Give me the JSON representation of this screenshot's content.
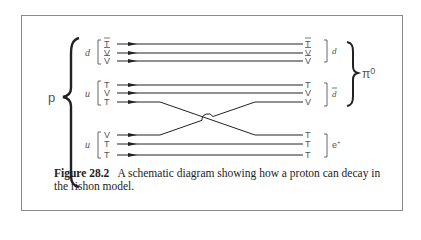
{
  "figure": {
    "number_label": "Figure 28.2",
    "caption": "A schematic diagram showing how a proton can decay in the rishon model."
  },
  "diagram": {
    "left_particle": "p",
    "right_composite": "π",
    "right_composite_superscript": "0",
    "input_groups": [
      {
        "label": "d",
        "bar": false,
        "rishons": [
          {
            "symbol": "T",
            "bar": true
          },
          {
            "symbol": "V",
            "bar": true
          },
          {
            "symbol": "V",
            "bar": true
          }
        ]
      },
      {
        "label": "u",
        "bar": false,
        "rishons": [
          {
            "symbol": "T",
            "bar": false
          },
          {
            "symbol": "V",
            "bar": false
          },
          {
            "symbol": "T",
            "bar": false
          }
        ]
      },
      {
        "label": "u",
        "bar": false,
        "rishons": [
          {
            "symbol": "V",
            "bar": false
          },
          {
            "symbol": "T",
            "bar": false
          },
          {
            "symbol": "T",
            "bar": false
          }
        ]
      }
    ],
    "output_groups": [
      {
        "label": "d",
        "bar": false,
        "rishons": [
          {
            "symbol": "T",
            "bar": true
          },
          {
            "symbol": "V",
            "bar": true
          },
          {
            "symbol": "V",
            "bar": true
          }
        ]
      },
      {
        "label": "d",
        "bar": true,
        "rishons": [
          {
            "symbol": "T",
            "bar": false
          },
          {
            "symbol": "V",
            "bar": false
          },
          {
            "symbol": "V",
            "bar": false
          }
        ]
      },
      {
        "label": "e",
        "superscript": "+",
        "rishons": [
          {
            "symbol": "T",
            "bar": false
          },
          {
            "symbol": "T",
            "bar": false
          },
          {
            "symbol": "T",
            "bar": false
          }
        ]
      }
    ],
    "crossing": "T from u (3rd line) swaps with V from lower u (1st line)"
  }
}
